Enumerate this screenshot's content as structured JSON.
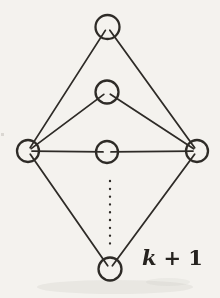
{
  "figure": {
    "background_color": "#f4f2ee",
    "stroke_color": "#2e2b27",
    "label": {
      "variable": "k",
      "operator": "+",
      "value": "1"
    }
  },
  "graph": {
    "nodes": [
      {
        "id": "top",
        "cx": 107.5,
        "cy": 27,
        "r": 12
      },
      {
        "id": "upper-middle",
        "cx": 107,
        "cy": 92,
        "r": 11.5
      },
      {
        "id": "left-hub",
        "cx": 28,
        "cy": 151,
        "r": 11
      },
      {
        "id": "center",
        "cx": 107,
        "cy": 152,
        "r": 11
      },
      {
        "id": "right-hub",
        "cx": 197,
        "cy": 151,
        "r": 11
      },
      {
        "id": "bottom",
        "cx": 110,
        "cy": 269,
        "r": 11.5
      }
    ],
    "edges": [
      [
        "top",
        "left-hub"
      ],
      [
        "top",
        "right-hub"
      ],
      [
        "upper-middle",
        "left-hub"
      ],
      [
        "upper-middle",
        "right-hub"
      ],
      [
        "left-hub",
        "center"
      ],
      [
        "center",
        "right-hub"
      ],
      [
        "left-hub",
        "bottom"
      ],
      [
        "right-hub",
        "bottom"
      ]
    ],
    "dotted_continuation": {
      "x": 110,
      "y1": 181,
      "y2": 247
    },
    "label_position": {
      "x": 142,
      "y": 265
    }
  }
}
